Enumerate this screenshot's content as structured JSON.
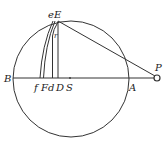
{
  "diagram": {
    "type": "geometry",
    "labels": {
      "B": "B",
      "A": "A",
      "P": "P",
      "E": "E",
      "e": "e",
      "r": "r",
      "f": "f",
      "F": "F",
      "d": "d",
      "D": "D",
      "S": "S"
    },
    "stroke_color": "#333333",
    "background": "#ffffff"
  }
}
